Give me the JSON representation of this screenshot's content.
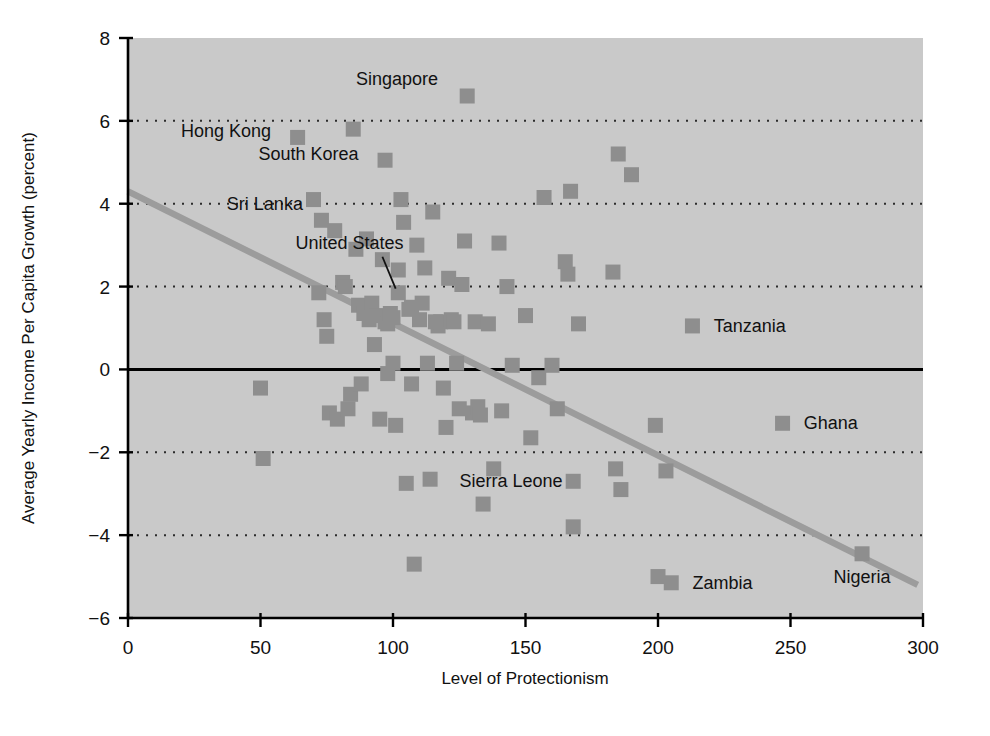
{
  "chart_data": {
    "type": "scatter",
    "title": "",
    "xlabel": "Level of Protectionism",
    "ylabel": "Average Yearly Income Per Capita Growth (percent)",
    "xlim": [
      0,
      300
    ],
    "ylim": [
      -6,
      8
    ],
    "xticks": [
      0,
      50,
      100,
      150,
      200,
      250,
      300
    ],
    "yticks": [
      -6,
      -4,
      -2,
      0,
      2,
      4,
      6,
      8
    ],
    "xtick_labels": [
      "0",
      "50",
      "100",
      "150",
      "200",
      "250",
      "300"
    ],
    "ytick_labels": [
      "−6",
      "−4",
      "−2",
      "0",
      "2",
      "4",
      "6",
      "8"
    ],
    "grid": "horizontal-dotted",
    "grid_values": [
      -4,
      -2,
      2,
      4,
      6
    ],
    "zero_line": 0,
    "legend": "none",
    "marker_shape": "square",
    "marker_color": "#8e8e8e",
    "plot_background": "#c9c9c9",
    "trend_line": {
      "name": "fitted regression line",
      "color": "#9c9c9c",
      "x_start": 0,
      "y_start": 4.3,
      "x_end": 298,
      "y_end": -5.2
    },
    "annotations": [
      {
        "label": "Singapore",
        "x": 128,
        "y": 6.6,
        "anchor": "end",
        "label_x": 117,
        "label_y": 7.0,
        "leader": false
      },
      {
        "label": "Hong Kong",
        "x": 64,
        "y": 5.6,
        "anchor": "end",
        "label_x": 54,
        "label_y": 5.75,
        "leader": false
      },
      {
        "label": "South Korea",
        "x": 97,
        "y": 5.05,
        "anchor": "end",
        "label_x": 87,
        "label_y": 5.2,
        "leader": false
      },
      {
        "label": "Sri Lanka",
        "x": null,
        "y": null,
        "anchor": "end",
        "label_x": 66,
        "label_y": 4.0,
        "leader": false
      },
      {
        "label": "United States",
        "x": 102,
        "y": 1.85,
        "anchor": "end",
        "label_x": 104,
        "label_y": 3.05,
        "leader": true,
        "leader_x1": 96,
        "leader_y1": 2.72,
        "leader_x2": 101,
        "leader_y2": 1.95
      },
      {
        "label": "Tanzania",
        "x": 213,
        "y": 1.05,
        "anchor": "start",
        "label_x": 221,
        "label_y": 1.05,
        "leader": false
      },
      {
        "label": "Ghana",
        "x": 247,
        "y": -1.3,
        "anchor": "start",
        "label_x": 255,
        "label_y": -1.3,
        "leader": false
      },
      {
        "label": "Sierra Leone",
        "x": 168,
        "y": -2.7,
        "anchor": "end",
        "label_x": 164,
        "label_y": -2.7,
        "leader": false
      },
      {
        "label": "Zambia",
        "x": 205,
        "y": -5.15,
        "anchor": "start",
        "label_x": 213,
        "label_y": -5.15,
        "leader": false
      },
      {
        "label": "Nigeria",
        "x": 277,
        "y": -4.45,
        "anchor": "middle",
        "label_x": 277,
        "label_y": -5.0,
        "leader": false
      }
    ],
    "points": [
      [
        50,
        -0.45
      ],
      [
        51,
        -2.15
      ],
      [
        64,
        5.6
      ],
      [
        70,
        4.1
      ],
      [
        72,
        1.85
      ],
      [
        73,
        3.6
      ],
      [
        74,
        1.2
      ],
      [
        75,
        0.8
      ],
      [
        76,
        -1.05
      ],
      [
        78,
        3.35
      ],
      [
        79,
        -1.2
      ],
      [
        81,
        2.1
      ],
      [
        82,
        2.0
      ],
      [
        83,
        -0.95
      ],
      [
        84,
        -0.6
      ],
      [
        85,
        5.8
      ],
      [
        86,
        2.9
      ],
      [
        87,
        1.55
      ],
      [
        88,
        -0.35
      ],
      [
        89,
        1.35
      ],
      [
        90,
        3.15
      ],
      [
        91,
        1.2
      ],
      [
        92,
        1.6
      ],
      [
        93,
        0.6
      ],
      [
        94,
        1.3
      ],
      [
        95,
        -1.2
      ],
      [
        96,
        2.65
      ],
      [
        97,
        5.05
      ],
      [
        97,
        1.15
      ],
      [
        98,
        1.1
      ],
      [
        98,
        -0.1
      ],
      [
        99,
        1.35
      ],
      [
        100,
        1.25
      ],
      [
        100,
        0.15
      ],
      [
        101,
        -1.35
      ],
      [
        102,
        1.85
      ],
      [
        102,
        2.4
      ],
      [
        103,
        4.1
      ],
      [
        104,
        3.55
      ],
      [
        105,
        -2.75
      ],
      [
        106,
        1.45
      ],
      [
        107,
        1.5
      ],
      [
        107,
        -0.35
      ],
      [
        108,
        -4.7
      ],
      [
        109,
        3.0
      ],
      [
        110,
        1.2
      ],
      [
        111,
        1.6
      ],
      [
        112,
        2.45
      ],
      [
        113,
        0.15
      ],
      [
        114,
        -2.65
      ],
      [
        115,
        3.8
      ],
      [
        116,
        1.15
      ],
      [
        117,
        1.05
      ],
      [
        118,
        1.15
      ],
      [
        119,
        -0.45
      ],
      [
        120,
        -1.4
      ],
      [
        121,
        2.2
      ],
      [
        122,
        1.2
      ],
      [
        123,
        1.15
      ],
      [
        124,
        0.15
      ],
      [
        125,
        -0.95
      ],
      [
        126,
        2.05
      ],
      [
        127,
        3.1
      ],
      [
        128,
        6.6
      ],
      [
        130,
        -1.05
      ],
      [
        131,
        1.15
      ],
      [
        132,
        -0.9
      ],
      [
        133,
        -1.1
      ],
      [
        134,
        -3.25
      ],
      [
        136,
        1.1
      ],
      [
        138,
        -2.4
      ],
      [
        140,
        3.05
      ],
      [
        141,
        -1.0
      ],
      [
        143,
        2.0
      ],
      [
        145,
        0.1
      ],
      [
        150,
        1.3
      ],
      [
        152,
        -1.65
      ],
      [
        155,
        -0.2
      ],
      [
        157,
        4.15
      ],
      [
        160,
        0.1
      ],
      [
        162,
        -0.95
      ],
      [
        165,
        2.6
      ],
      [
        166,
        2.3
      ],
      [
        167,
        4.3
      ],
      [
        168,
        -2.7
      ],
      [
        168,
        -3.8
      ],
      [
        170,
        1.1
      ],
      [
        183,
        2.35
      ],
      [
        184,
        -2.4
      ],
      [
        185,
        5.2
      ],
      [
        186,
        -2.9
      ],
      [
        190,
        4.7
      ],
      [
        199,
        -1.35
      ],
      [
        200,
        -5.0
      ],
      [
        205,
        -5.15
      ],
      [
        203,
        -2.45
      ],
      [
        213,
        1.05
      ],
      [
        247,
        -1.3
      ],
      [
        277,
        -4.45
      ]
    ]
  }
}
